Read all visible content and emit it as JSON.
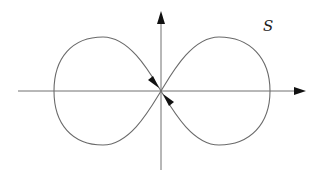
{
  "diagram": {
    "type": "lemniscate-like closed curve with coordinate axes",
    "curve_label": "S",
    "colors": {
      "curve": "#6a6a6a",
      "axis": "#707070",
      "arrowhead": "#111111",
      "background": "#ffffff"
    },
    "axes": {
      "horizontal": {
        "x1": 18,
        "y": 91,
        "x2": 305,
        "arrow": "right"
      },
      "vertical": {
        "x": 161,
        "y1": 170,
        "y2": 12,
        "arrow": "up"
      }
    },
    "curve": {
      "center": [
        161,
        91
      ],
      "left_lobe": {
        "left": 54,
        "top": 37,
        "bottom": 145
      },
      "right_lobe": {
        "right": 270,
        "top": 37,
        "bottom": 145
      },
      "direction_arrows": [
        {
          "position": "upper-left near origin",
          "pointing": "toward origin (down-right)"
        },
        {
          "position": "lower-right near origin",
          "pointing": "toward origin (up-left)"
        }
      ]
    }
  }
}
